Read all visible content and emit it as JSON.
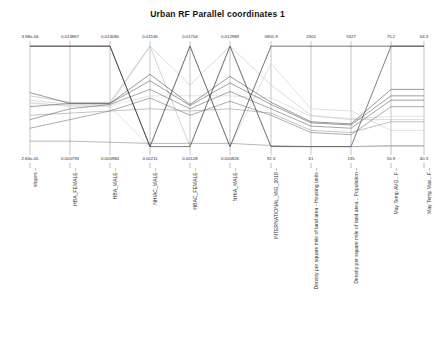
{
  "title": "Urban RF Parallel coordinates 1",
  "chart_data": {
    "type": "line",
    "title": "Urban RF Parallel coordinates 1",
    "subtype": "parallel-coordinates",
    "xlabel": "",
    "ylabel": "",
    "grid": false,
    "legend": "none",
    "axes": [
      {
        "name": "slopes",
        "min": "2.84e-05",
        "max": "3.98e-04",
        "x": 30
      },
      {
        "name": "HBA_FEMALE",
        "min": "0.000793",
        "max": "0.013867",
        "x": 70
      },
      {
        "name": "HBA_MALE",
        "min": "0.000984",
        "max": "0.013080",
        "x": 110
      },
      {
        "name": "NHIAC_MALE",
        "min": "0.00211",
        "max": "0.01536",
        "x": 150
      },
      {
        "name": "HBAC_FEMALE",
        "min": "0.00128",
        "max": "0.01704",
        "x": 190
      },
      {
        "name": "NHIA_MALE",
        "min": "0.000826",
        "max": "0.012989",
        "x": 230
      },
      {
        "name": "INTERNATIONAL_MIG_2018",
        "min": "92.3",
        "max": "5805.9",
        "x": 271
      },
      {
        "name": "Density per square mile of land area - Housing units",
        "min": "61",
        "max": "2305",
        "x": 311
      },
      {
        "name": "Density per square mile of land area... Population",
        "min": "135",
        "max": "5327",
        "x": 351
      },
      {
        "name": "May Temp AVG...F",
        "min": "50.9",
        "max": "75.2",
        "x": 391
      },
      {
        "name": "May Temp Max...F",
        "min": "40.3",
        "max": "64.3",
        "x": 424
      }
    ],
    "series": [
      {
        "name": "line-1",
        "shade": "#3a3a3a",
        "width": 0.7,
        "values": [
          0.98,
          0.98,
          0.98,
          0.05,
          0.98,
          0.05,
          0.98,
          0.98,
          0.98,
          0.98,
          0.98
        ]
      },
      {
        "name": "line-2",
        "shade": "#4a4a4a",
        "width": 0.7,
        "values": [
          0.98,
          0.98,
          0.98,
          0.05,
          0.05,
          0.98,
          0.05,
          0.05,
          0.05,
          0.98,
          0.98
        ]
      },
      {
        "name": "line-3",
        "shade": "#555555",
        "width": 0.6,
        "values": [
          0.55,
          0.45,
          0.45,
          0.72,
          0.44,
          0.7,
          0.46,
          0.28,
          0.26,
          0.58,
          0.58
        ]
      },
      {
        "name": "line-4",
        "shade": "#606060",
        "width": 0.6,
        "values": [
          0.42,
          0.45,
          0.45,
          0.66,
          0.43,
          0.64,
          0.44,
          0.27,
          0.25,
          0.52,
          0.52
        ]
      },
      {
        "name": "line-5",
        "shade": "#6a6a6a",
        "width": 0.6,
        "values": [
          0.3,
          0.4,
          0.44,
          0.58,
          0.4,
          0.56,
          0.4,
          0.24,
          0.22,
          0.48,
          0.48
        ]
      },
      {
        "name": "line-6",
        "shade": "#757575",
        "width": 0.6,
        "values": [
          0.22,
          0.3,
          0.38,
          0.5,
          0.34,
          0.47,
          0.34,
          0.18,
          0.16,
          0.42,
          0.42
        ]
      },
      {
        "name": "line-7",
        "shade": "#8a8a8a",
        "width": 0.6,
        "values": [
          0.1,
          0.1,
          0.09,
          0.08,
          0.08,
          0.08,
          0.06,
          0.05,
          0.05,
          0.06,
          0.06
        ]
      },
      {
        "name": "line-8",
        "shade": "#b5b5b5",
        "width": 0.6,
        "values": [
          0.52,
          0.46,
          0.46,
          0.98,
          0.05,
          0.98,
          0.05,
          0.05,
          0.05,
          0.05,
          0.05
        ]
      },
      {
        "name": "line-9",
        "shade": "#c2c2c2",
        "width": 0.6,
        "values": [
          0.48,
          0.44,
          0.44,
          0.98,
          0.62,
          0.98,
          0.62,
          0.34,
          0.3,
          0.3,
          0.3
        ]
      },
      {
        "name": "line-10",
        "shade": "#cccccc",
        "width": 0.6,
        "values": [
          0.46,
          0.42,
          0.42,
          0.05,
          0.98,
          0.05,
          0.82,
          0.4,
          0.38,
          0.2,
          0.2
        ]
      },
      {
        "name": "line-11",
        "shade": "#d2d2d2",
        "width": 0.6,
        "values": [
          0.45,
          0.43,
          0.43,
          0.52,
          0.52,
          0.52,
          0.5,
          0.33,
          0.31,
          0.33,
          0.33
        ]
      },
      {
        "name": "line-12",
        "shade": "#9a9a9a",
        "width": 0.6,
        "values": [
          0.34,
          0.36,
          0.38,
          0.4,
          0.38,
          0.4,
          0.36,
          0.2,
          0.18,
          0.28,
          0.28
        ]
      }
    ]
  },
  "ticks": {
    "top": [
      "3.98e-04",
      "0.013867",
      "0.013080",
      "0.01536",
      "0.01704",
      "0.012989",
      "5805.9",
      "2305",
      "5327",
      "75.2",
      "64.3"
    ],
    "bottom": [
      "2.84e-05",
      "0.000793",
      "0.000984",
      "0.00211",
      "0.00128",
      "0.000826",
      "92.3",
      "61",
      "135",
      "50.9",
      "40.3"
    ]
  },
  "axis_names": [
    "slopes",
    "HBA_FEMALE",
    "HBA_MALE",
    "NHIAC_MALE",
    "HBAC_FEMALE",
    "NHIA_MALE",
    "INTERNATIONAL_MIG_2018",
    "Density per square mile of land area - Housing units",
    "Density per square mile of land area... Population",
    "May Temp AVG...F",
    "May Temp Max...F"
  ],
  "colors": {
    "background": "#ffffff",
    "axis_line": "#9aa0a6",
    "text": "#222222"
  }
}
